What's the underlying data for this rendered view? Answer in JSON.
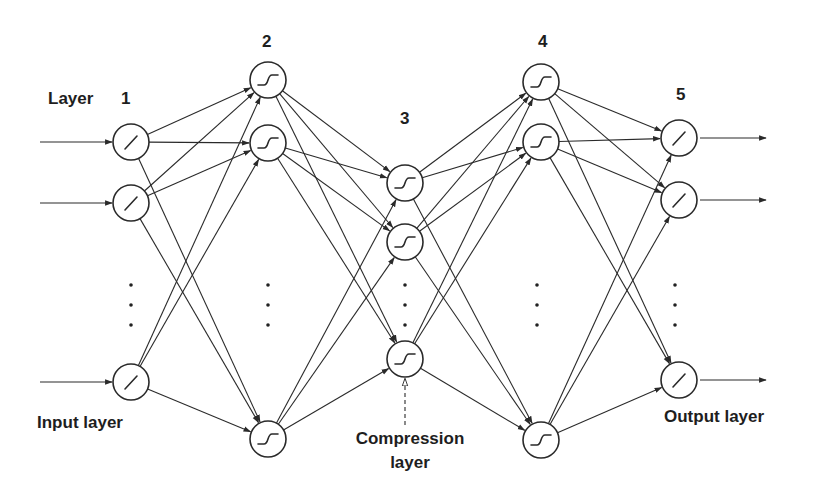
{
  "diagram": {
    "type": "autoassociative neural network",
    "labels": {
      "layer_word": "Layer",
      "input_layer": "Input layer",
      "output_layer": "Output layer",
      "compression_line1": "Compression",
      "compression_line2": "layer"
    },
    "layers": [
      {
        "number": "1",
        "activation": "linear",
        "visible_nodes": 3,
        "has_ellipsis": true,
        "role": "input"
      },
      {
        "number": "2",
        "activation": "sigmoid",
        "visible_nodes": 3,
        "has_ellipsis": true,
        "role": "hidden"
      },
      {
        "number": "3",
        "activation": "sigmoid",
        "visible_nodes": 3,
        "has_ellipsis": true,
        "role": "compression"
      },
      {
        "number": "4",
        "activation": "sigmoid",
        "visible_nodes": 3,
        "has_ellipsis": true,
        "role": "hidden"
      },
      {
        "number": "5",
        "activation": "linear",
        "visible_nodes": 3,
        "has_ellipsis": true,
        "role": "output"
      }
    ],
    "connectivity": "fully-connected between adjacent layers",
    "colors": {
      "ink": "#2a2a2a",
      "background": "#ffffff"
    }
  }
}
